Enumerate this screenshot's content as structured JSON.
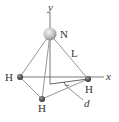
{
  "diagram": {
    "labels": {
      "y_axis": "y",
      "x_axis": "x",
      "nitrogen": "N",
      "bond_length": "L",
      "hydrogen_left": "H",
      "hydrogen_right": "H",
      "hydrogen_bottom": "H",
      "distance": "d"
    },
    "colors": {
      "nitrogen": "#c8c8c8",
      "hydrogen": "#444444",
      "lines": "#8a8a8a"
    }
  }
}
